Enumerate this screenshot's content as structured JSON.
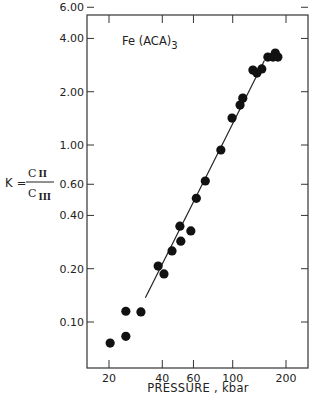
{
  "chart_data": {
    "type": "scatter",
    "title": "",
    "annotation": "Fe(ACA)3",
    "annotation_main": "Fe (ACA)",
    "annotation_sub": "3",
    "xlabel": "PRESSURE , kbar",
    "ylabel": "K = CII / CIII",
    "ylabel_parts": {
      "k": "K =",
      "num": "C",
      "num_sub": "II",
      "den": "C",
      "den_sub": "III"
    },
    "xscale": "log",
    "yscale": "log",
    "xlim": [
      15,
      250
    ],
    "ylim": [
      0.055,
      6.0
    ],
    "grid": false,
    "legend": null,
    "x_ticks": [
      {
        "value": 20,
        "label": "20"
      },
      {
        "value": 40,
        "label": "40"
      },
      {
        "value": 60,
        "label": "60"
      },
      {
        "value": 100,
        "label": "100"
      },
      {
        "value": 200,
        "label": "200"
      }
    ],
    "y_ticks": [
      {
        "value": 6.0,
        "label": "6.00"
      },
      {
        "value": 4.0,
        "label": "4.00"
      },
      {
        "value": 2.0,
        "label": "2.00"
      },
      {
        "value": 1.0,
        "label": "1.00"
      },
      {
        "value": 0.6,
        "label": "0.60"
      },
      {
        "value": 0.4,
        "label": "0.40"
      },
      {
        "value": 0.2,
        "label": "0.20"
      },
      {
        "value": 0.1,
        "label": "0.10"
      }
    ],
    "series": [
      {
        "name": "Fe(ACA)3 data",
        "marker": "filled-circle",
        "color": "#111111",
        "points": [
          {
            "x": 20.3,
            "y": 0.076
          },
          {
            "x": 24.9,
            "y": 0.083
          },
          {
            "x": 24.9,
            "y": 0.115
          },
          {
            "x": 30.3,
            "y": 0.114
          },
          {
            "x": 37.9,
            "y": 0.207
          },
          {
            "x": 40.9,
            "y": 0.187
          },
          {
            "x": 45.4,
            "y": 0.252
          },
          {
            "x": 50.9,
            "y": 0.286
          },
          {
            "x": 50.3,
            "y": 0.348
          },
          {
            "x": 58.0,
            "y": 0.327
          },
          {
            "x": 62.3,
            "y": 0.5
          },
          {
            "x": 70.0,
            "y": 0.626
          },
          {
            "x": 85.7,
            "y": 0.937
          },
          {
            "x": 99.1,
            "y": 1.42
          },
          {
            "x": 110,
            "y": 1.68
          },
          {
            "x": 114,
            "y": 1.84
          },
          {
            "x": 130,
            "y": 2.65
          },
          {
            "x": 137,
            "y": 2.55
          },
          {
            "x": 146,
            "y": 2.69
          },
          {
            "x": 158,
            "y": 3.14
          },
          {
            "x": 169,
            "y": 3.14
          },
          {
            "x": 174,
            "y": 3.31
          },
          {
            "x": 180,
            "y": 3.14
          }
        ]
      },
      {
        "name": "fit line",
        "type": "line",
        "color": "#222222",
        "points": [
          {
            "x": 32.1,
            "y": 0.137
          },
          {
            "x": 151,
            "y": 3.0
          }
        ]
      }
    ]
  },
  "colors": {
    "ink": "#1a1a1a",
    "background": "#ffffff"
  }
}
